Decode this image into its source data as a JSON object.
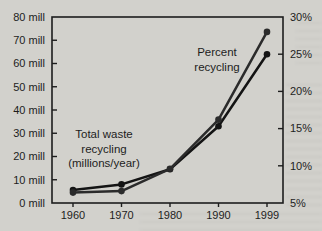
{
  "page": {
    "background_color": "#d2d1cc",
    "ink_color": "#1d1d1d"
  },
  "chart_data": {
    "type": "line",
    "title": "",
    "grid": false,
    "legend_position": "none",
    "x_categories": [
      "1960",
      "1970",
      "1980",
      "1990",
      "1999"
    ],
    "left_axis": {
      "min": 0,
      "max": 80,
      "tick_values": [
        0,
        10,
        20,
        30,
        40,
        50,
        60,
        70,
        80
      ],
      "tick_labels": [
        "0 mill",
        "10 mill",
        "20 mill",
        "30 mill",
        "40 mill",
        "50 mill",
        "60 mill",
        "70 mill",
        "80 mill"
      ]
    },
    "right_axis": {
      "min": 5,
      "max": 30,
      "tick_values": [
        5,
        10,
        15,
        20,
        25,
        30
      ],
      "tick_labels": [
        "5%",
        "10%",
        "15%",
        "20%",
        "25%",
        "30%"
      ]
    },
    "series": [
      {
        "name": "Total waste recycling (millions/year)",
        "axis": "left",
        "values": [
          5.6,
          8,
          14.5,
          33,
          64
        ],
        "color": "#141414",
        "marker": "circle"
      },
      {
        "name": "Percent recycling",
        "axis": "right",
        "values": [
          6.4,
          6.6,
          9.6,
          16.2,
          28
        ],
        "color": "#2b2b2b",
        "marker": "circle"
      }
    ],
    "annotations": [
      {
        "lines": [
          "Total waste",
          "recycling",
          "(millions/year)"
        ],
        "x": 104,
        "y": 130
      },
      {
        "lines": [
          "Percent",
          "recycling"
        ],
        "x": 217,
        "y": 48
      }
    ]
  }
}
